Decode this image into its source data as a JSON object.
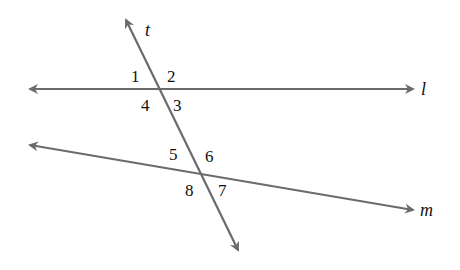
{
  "diagram": {
    "line_color": "#6b6b6b",
    "lines": [
      {
        "id": "l",
        "label": "l",
        "x1": 30,
        "y1": 89,
        "x2": 413,
        "y2": 89
      },
      {
        "id": "m",
        "label": "m",
        "x1": 30,
        "y1": 145,
        "x2": 413,
        "y2": 210
      },
      {
        "id": "t",
        "label": "t",
        "x1": 126,
        "y1": 20,
        "x2": 238,
        "y2": 250
      }
    ],
    "angles": [
      {
        "label": "1",
        "x": 131,
        "y": 82
      },
      {
        "label": "2",
        "x": 167,
        "y": 82
      },
      {
        "label": "3",
        "x": 173,
        "y": 111
      },
      {
        "label": "4",
        "x": 141,
        "y": 111
      },
      {
        "label": "5",
        "x": 169,
        "y": 160
      },
      {
        "label": "6",
        "x": 205,
        "y": 162
      },
      {
        "label": "7",
        "x": 218,
        "y": 196
      },
      {
        "label": "8",
        "x": 185,
        "y": 196
      }
    ]
  }
}
